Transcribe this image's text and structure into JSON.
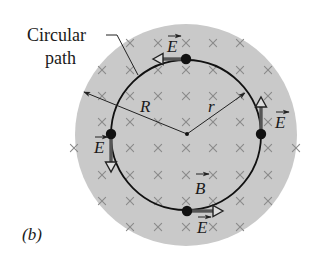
{
  "figure": {
    "panel_label": "(b)",
    "callout": {
      "line1": "Circular",
      "line2": "path"
    },
    "labels": {
      "big_radius": "R",
      "small_radius": "r",
      "field_b": "B",
      "field_e": "E"
    },
    "colors": {
      "disk_fill": "#c9c9c9",
      "x_mark": "#8a8a8a",
      "path_stroke": "#111111",
      "arrow_shaft": "#555555",
      "arrow_head_fill": "#dcdcdc",
      "text": "#1a1a1a"
    },
    "geometry": {
      "disk": {
        "cx": 186,
        "cy": 135,
        "r": 111
      },
      "path_circle": {
        "cx": 186,
        "cy": 135,
        "r": 75
      },
      "center_dot": {
        "x": 187,
        "y": 134
      },
      "R_arrow_tip": {
        "x": 84,
        "y": 92
      },
      "r_arrow_tip": {
        "x": 245,
        "y": 93
      }
    },
    "e_vectors": [
      {
        "position": "top",
        "dot": [
          186,
          59
        ],
        "tip": [
          153,
          59
        ],
        "label": [
          170,
          52
        ]
      },
      {
        "position": "right",
        "dot": [
          261,
          134
        ],
        "tip": [
          261,
          97
        ],
        "label": [
          278,
          128
        ]
      },
      {
        "position": "left",
        "dot": [
          111,
          134
        ],
        "tip": [
          111,
          172
        ],
        "label": [
          97,
          153
        ]
      },
      {
        "position": "bottom",
        "dot": [
          187,
          211
        ],
        "tip": [
          223,
          211
        ],
        "label": [
          200,
          233
        ]
      }
    ],
    "x_grid": {
      "rows": [
        {
          "y": 43,
          "xs": [
            130,
            158,
            186,
            213,
            240
          ]
        },
        {
          "y": 70,
          "xs": [
            102,
            130,
            158,
            186,
            213,
            240,
            268
          ]
        },
        {
          "y": 96,
          "xs": [
            102,
            130,
            158,
            186,
            213,
            240,
            268
          ]
        },
        {
          "y": 122,
          "xs": [
            102,
            130,
            158,
            186,
            213,
            240,
            268
          ]
        },
        {
          "y": 148,
          "xs": [
            74,
            130,
            158,
            186,
            213,
            240,
            268,
            296
          ]
        },
        {
          "y": 175,
          "xs": [
            102,
            130,
            158,
            186,
            213,
            240,
            268
          ]
        },
        {
          "y": 201,
          "xs": [
            102,
            130,
            158,
            186,
            213,
            240,
            268
          ]
        },
        {
          "y": 227,
          "xs": [
            130,
            158,
            186,
            213,
            240
          ]
        }
      ]
    }
  }
}
